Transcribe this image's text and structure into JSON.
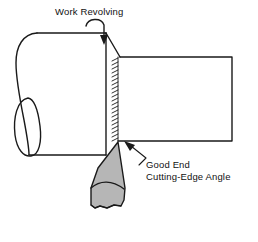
{
  "figure": {
    "background_color": "#ffffff",
    "line_color": "#1a1a1a",
    "tool_fill_color": "#b6b6b6",
    "width": 258,
    "height": 242
  },
  "labels": {
    "work_revolving": "Work Revolving",
    "good_end": "Good End",
    "cutting_edge_angle": "Cutting-Edge Angle"
  },
  "icons": {
    "rotation_arrow": "curved-rotation-arrow-icon",
    "leader_arrow": "leader-arrow-icon"
  },
  "parts": {
    "workpiece_large": "workpiece-large-diameter",
    "workpiece_small": "workpiece-small-diameter",
    "machined_surface": "machined-surface-hatching",
    "cutting_tool": "cutting-tool-body",
    "tool_break": "tool-break-line"
  }
}
